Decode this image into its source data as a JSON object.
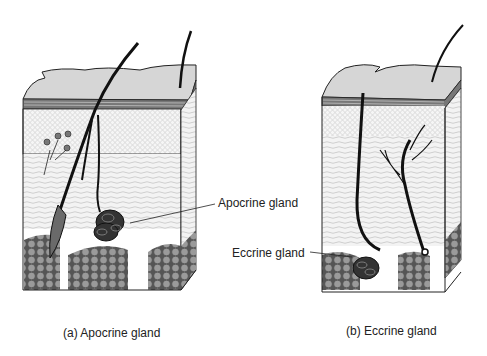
{
  "figure": {
    "panels": [
      {
        "caption": "(a)  Apocrine gland",
        "callout": "Apocrine gland"
      },
      {
        "caption": "(b)  Eccrine gland",
        "callout": "Eccrine gland"
      }
    ]
  },
  "colors": {
    "ink": "#1a1a1a",
    "skin_surface": "#d8d8d8",
    "fat": "#8a8a8a",
    "dermis": "#f2f2f2"
  }
}
